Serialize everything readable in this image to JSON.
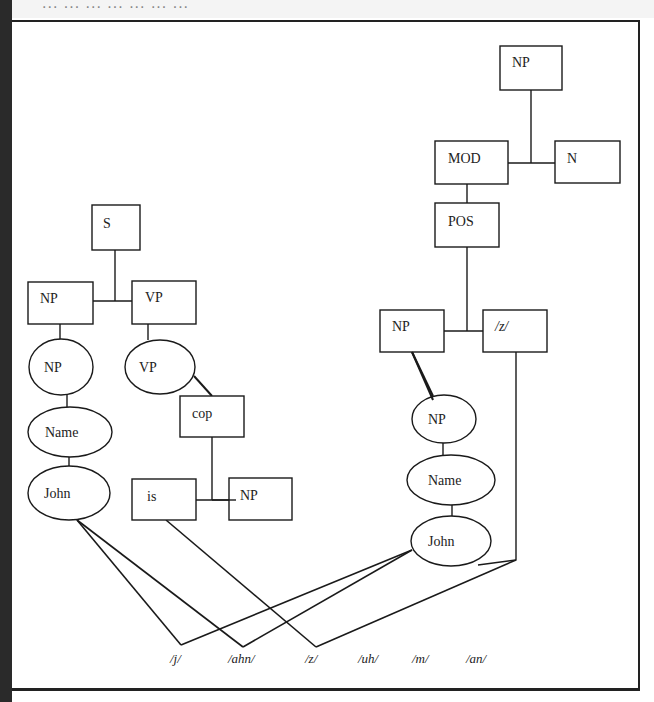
{
  "header": {
    "partial_caption": "... ... ... ... ... ... ..."
  },
  "diagram": {
    "title": "",
    "type": "syntactic-phonological parse tree",
    "left_tree": {
      "S": "S",
      "NP_box": "NP",
      "VP_box": "VP",
      "NP_ellipse": "NP",
      "VP_ellipse": "VP",
      "Name_ellipse": "Name",
      "John_ellipse": "John",
      "cop_box": "cop",
      "is_box": "is",
      "NP_obj_box": "NP"
    },
    "right_tree": {
      "NP_top": "NP",
      "MOD": "MOD",
      "N": "N",
      "POS": "POS",
      "NP_box": "NP",
      "z_box": "/z/",
      "NP_ellipse": "NP",
      "Name_ellipse": "Name",
      "John_ellipse": "John"
    },
    "phonemes": [
      "/j/",
      "/ahn/",
      "/z/",
      "/uh/",
      "/m/",
      "/an/"
    ],
    "edges": [
      [
        "S",
        "NP_box"
      ],
      [
        "S",
        "VP_box"
      ],
      [
        "NP_box",
        "NP_ellipse"
      ],
      [
        "NP_ellipse",
        "Name_ellipse"
      ],
      [
        "Name_ellipse",
        "John_ellipse"
      ],
      [
        "VP_box",
        "VP_ellipse"
      ],
      [
        "VP_ellipse",
        "cop_box"
      ],
      [
        "cop_box",
        "is_box"
      ],
      [
        "cop_box",
        "NP_obj_box"
      ],
      [
        "NP_top",
        "MOD"
      ],
      [
        "NP_top",
        "N"
      ],
      [
        "MOD",
        "POS"
      ],
      [
        "POS",
        "NP_box_r"
      ],
      [
        "POS",
        "z_box"
      ],
      [
        "NP_box_r",
        "NP_ellipse_r"
      ],
      [
        "NP_ellipse_r",
        "Name_ellipse_r"
      ],
      [
        "Name_ellipse_r",
        "John_ellipse_r"
      ],
      [
        "John_ellipse",
        "/j/"
      ],
      [
        "John_ellipse",
        "/ahn/"
      ],
      [
        "is_box",
        "/z/"
      ],
      [
        "John_ellipse_r",
        "/j/"
      ],
      [
        "John_ellipse_r",
        "/ahn/"
      ],
      [
        "z_box",
        "/z/"
      ]
    ]
  },
  "colors": {
    "line": "#1a1a1a",
    "background": "#ffffff",
    "left_bar": "#2a2a2a"
  }
}
